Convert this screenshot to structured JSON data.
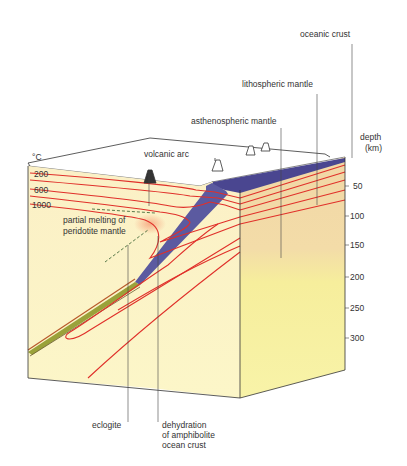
{
  "diagram": {
    "labels": {
      "oceanic_crust": "oceanic crust",
      "lithospheric_mantle": "lithospheric mantle",
      "asthenospheric_mantle": "asthenospheric mantle",
      "volcanic_arc": "volcanic arc",
      "partial_melting_line1": "partial melting of",
      "partial_melting_line2": "peridotite mantle",
      "eclogite": "eclogite",
      "dehydration_line1": "dehydration",
      "dehydration_line2": "of amphibolite",
      "dehydration_line3": "ocean crust"
    },
    "temperature_axis": {
      "unit": "°C",
      "ticks": [
        "200",
        "600",
        "1000"
      ]
    },
    "depth_axis": {
      "title_line1": "depth",
      "title_line2": "(km)",
      "ticks": [
        "50",
        "100",
        "150",
        "200",
        "250",
        "300"
      ]
    },
    "colors": {
      "isotherm": "#e0302a",
      "oceanic_crust": "#4a4690",
      "lithosphere": "#f3d9a8",
      "asthenosphere": "#f7f09a",
      "left_face": "#fbf3c6",
      "eclogite_band": "#9aa23a"
    }
  }
}
